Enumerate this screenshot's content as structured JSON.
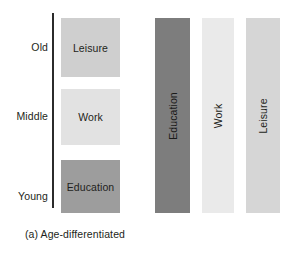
{
  "figure": {
    "panels": [
      {
        "id": "a",
        "caption": "(a) Age-differentiated",
        "axis_label_name": "age-axis",
        "age_labels": [
          {
            "key": "old",
            "label": "Old"
          },
          {
            "key": "middle",
            "label": "Middle"
          },
          {
            "key": "young",
            "label": "Young"
          }
        ],
        "boxes": [
          {
            "key": "leisure",
            "label": "Leisure",
            "color": "#cfcfcf",
            "age_stage": "Old"
          },
          {
            "key": "work",
            "label": "Work",
            "color": "#e2e2e2",
            "age_stage": "Middle"
          },
          {
            "key": "education",
            "label": "Education",
            "color": "#9d9d9d",
            "age_stage": "Young"
          }
        ]
      },
      {
        "id": "b",
        "caption": "(b) Age-integrated",
        "bars": [
          {
            "key": "education",
            "label": "Education",
            "color": "#7d7d7d"
          },
          {
            "key": "work",
            "label": "Work",
            "color": "#eaeaea"
          },
          {
            "key": "leisure",
            "label": "Leisure",
            "color": "#d6d6d6"
          }
        ]
      }
    ]
  },
  "chart_data": {
    "type": "diagram",
    "panels": [
      {
        "name": "(a) Age-differentiated",
        "axis": "vertical age axis",
        "categories": [
          "Young",
          "Middle",
          "Old"
        ],
        "blocks": [
          {
            "age_stage": "Old",
            "activity": "Leisure",
            "shade": "#cfcfcf"
          },
          {
            "age_stage": "Middle",
            "activity": "Work",
            "shade": "#e2e2e2"
          },
          {
            "age_stage": "Young",
            "activity": "Education",
            "shade": "#9d9d9d"
          }
        ]
      },
      {
        "name": "(b) Age-integrated",
        "axis": "none",
        "categories": [
          "Education",
          "Work",
          "Leisure"
        ],
        "blocks": [
          {
            "age_stage": "all ages",
            "activity": "Education",
            "shade": "#7d7d7d"
          },
          {
            "age_stage": "all ages",
            "activity": "Work",
            "shade": "#eaeaea"
          },
          {
            "age_stage": "all ages",
            "activity": "Leisure",
            "shade": "#d6d6d6"
          }
        ]
      }
    ]
  }
}
